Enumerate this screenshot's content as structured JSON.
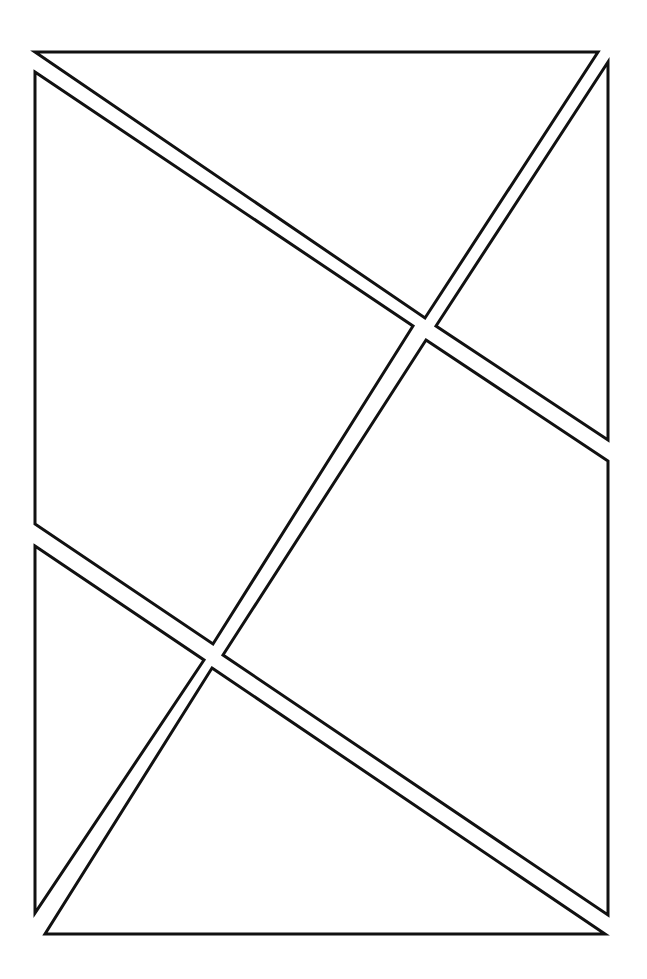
{
  "diagram": {
    "type": "comic-panel-layout",
    "width": 647,
    "height": 979,
    "background": "#ffffff",
    "stroke_color": "#111111",
    "stroke_width": 3,
    "panels": [
      {
        "id": "panel-1",
        "shape": "triangle",
        "points": "35,52 598,52 425,318"
      },
      {
        "id": "panel-2",
        "shape": "quadrilateral",
        "points": "35,72 413,326 213,644 35,524"
      },
      {
        "id": "panel-3",
        "shape": "triangle",
        "points": "608,62 608,440 436,326"
      },
      {
        "id": "panel-4",
        "shape": "quadrilateral",
        "points": "426,340 608,461 608,915 223,655"
      },
      {
        "id": "panel-5",
        "shape": "triangle",
        "points": "35,546 204,660 35,913"
      },
      {
        "id": "panel-6",
        "shape": "triangle",
        "points": "212,668 605,934 45,934"
      }
    ]
  }
}
